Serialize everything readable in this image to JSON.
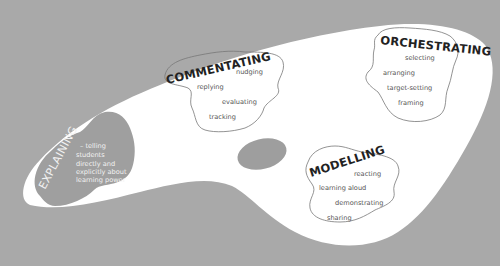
{
  "diagram": {
    "type": "palette-metaphor",
    "colors": {
      "background": "#a9a9a9",
      "palette": "#ffffff",
      "thumb_hole": "#9e9e9e",
      "explaining_blob": "#9f9f9f",
      "cloud_outline": "#777777",
      "title_text": "#222222",
      "item_text": "#555555",
      "explaining_text": "#f2f2f2"
    },
    "regions": {
      "explaining": {
        "title": "EXPLAINING",
        "lines": [
          "– telling",
          "students",
          "directly and",
          "explicitly about",
          "learning power"
        ]
      },
      "commentating": {
        "title": "COMMENTATING",
        "items": [
          "nudging",
          "replying",
          "evaluating",
          "tracking"
        ]
      },
      "orchestrating": {
        "title": "ORCHESTRATING",
        "items": [
          "selecting",
          "arranging",
          "target-setting",
          "framing"
        ]
      },
      "modelling": {
        "title": "MODELLING",
        "items": [
          "reacting",
          "learning aloud",
          "demonstrating",
          "sharing"
        ]
      }
    }
  }
}
